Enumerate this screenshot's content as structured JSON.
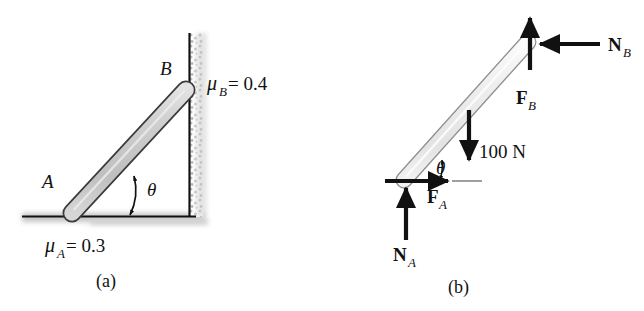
{
  "figure": {
    "panels": [
      {
        "id": "a",
        "caption": "(a)",
        "labels": {
          "point_a": "A",
          "point_b": "B",
          "angle": "θ",
          "mu_a_mu": "μ",
          "mu_a_sub": "A",
          "mu_a_value": "= 0.3",
          "mu_b_mu": "μ",
          "mu_b_sub": "B",
          "mu_b_value": "= 0.4"
        }
      },
      {
        "id": "b",
        "caption": "(b)",
        "labels": {
          "angle": "θ",
          "weight": "100 N",
          "force_a_main": "F",
          "force_a_sub": "A",
          "force_b_main": "F",
          "force_b_sub": "B",
          "normal_a_main": "N",
          "normal_a_sub": "A",
          "normal_b_main": "N",
          "normal_b_sub": "B"
        }
      }
    ],
    "colors": {
      "ink": "#111111",
      "rod_fill_a": "#c9c9c9",
      "rod_fill_b": "#ebebeb",
      "rod_stroke": "#3a3a3a",
      "shadow": "#bdbdbd",
      "background": "#ffffff"
    }
  }
}
